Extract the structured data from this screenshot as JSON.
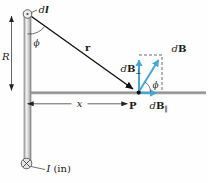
{
  "figure": {
    "labels": {
      "dl": {
        "d": "d",
        "vec": "l"
      },
      "R": "R",
      "phi_top": "ϕ",
      "r": "r",
      "x": "x",
      "P": "P",
      "dB_perp": {
        "d": "d",
        "B": "B",
        "sub": "⊥"
      },
      "dB": {
        "d": "d",
        "B": "B"
      },
      "dB_parallel": {
        "d": "d",
        "B": "B",
        "sub": "∥"
      },
      "phi_at_P": "ϕ",
      "current": {
        "I": "I",
        "suffix": "(in)"
      }
    },
    "colors": {
      "vector_blue": "#46a7d7",
      "axis_gray": "#9e9e9e",
      "rod_light": "#f0f0f0",
      "rod_dark": "#969696",
      "label_ink": "#1c1c1c"
    }
  }
}
